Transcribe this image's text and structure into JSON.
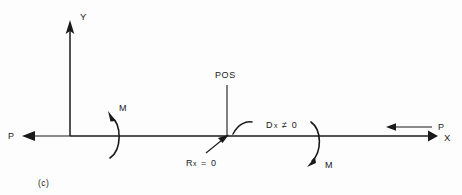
{
  "figure": {
    "caption": "(c)",
    "background_color": "#fdfdfd",
    "ink_color": "#1a1a1a"
  },
  "axes": {
    "y_axis_label": "Y",
    "x_axis_label": "X",
    "origin_x": 70,
    "origin_y": 136,
    "y_top": 22,
    "x_right": 437
  },
  "labels": {
    "pos": "POS",
    "load_left": "P",
    "load_right": "P",
    "moment_left": "M",
    "moment_right": "M",
    "reaction_zero": "Rx = 0",
    "reaction_zero_base": "R",
    "reaction_zero_sub": "x",
    "reaction_zero_rest": "= 0",
    "displacement_nonzero": "Dx ≠ 0",
    "displacement_base": "D",
    "displacement_sub": "x",
    "displacement_rest": "≠ 0"
  },
  "annotations": [
    {
      "name": "pos-leader",
      "text": "POS",
      "description": "vertical leader line from POS label down to point on X axis"
    },
    {
      "name": "reaction-callout",
      "text": "Rx = 0",
      "description": "diagonal arrow pointing up-right to the POS point"
    },
    {
      "name": "displacement-callout",
      "text": "Dx ≠ 0",
      "description": "small hooked arc with arrowhead just right of POS point"
    }
  ]
}
